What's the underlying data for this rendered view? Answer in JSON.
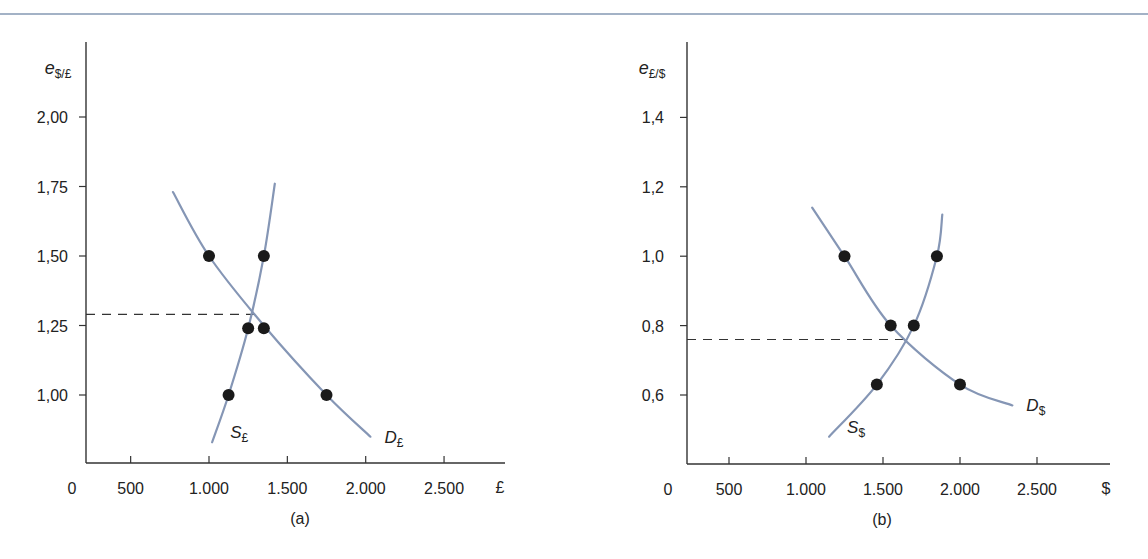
{
  "colors": {
    "curve": "#8596b5",
    "axis": "#333333",
    "point": "#1a1a1a",
    "rule": "#a3b2c6"
  },
  "chart_data": [
    {
      "type": "line",
      "panel_label": "(a)",
      "ylabel_main": "e",
      "ylabel_sub": "$/£",
      "xunit": "£",
      "xlim": [
        0,
        2700
      ],
      "ylim": [
        0.8,
        2.12
      ],
      "x_ticks": [
        500,
        1000,
        1500,
        2000,
        2500
      ],
      "x_tick_labels": [
        "500",
        "1.000",
        "1.500",
        "2.000",
        "2.500"
      ],
      "x_origin_label": "0",
      "y_ticks": [
        1.0,
        1.25,
        1.5,
        1.75,
        2.0
      ],
      "y_tick_labels": [
        "1,00",
        "1,25",
        "1,50",
        "1,75",
        "2,00"
      ],
      "equilibrium_rate": 1.29,
      "series": [
        {
          "name": "D",
          "sub": "£",
          "kind": "demand",
          "curve": [
            [
              770,
              1.73
            ],
            [
              1000,
              1.5
            ],
            [
              1350,
              1.25
            ],
            [
              1750,
              1.0
            ],
            [
              2030,
              0.85
            ]
          ],
          "points": [
            [
              1000,
              1.5
            ],
            [
              1350,
              1.24
            ],
            [
              1750,
              1.0
            ]
          ]
        },
        {
          "name": "S",
          "sub": "£",
          "kind": "supply",
          "curve": [
            [
              1020,
              0.83
            ],
            [
              1125,
              1.0
            ],
            [
              1250,
              1.24
            ],
            [
              1350,
              1.5
            ],
            [
              1420,
              1.76
            ]
          ],
          "points": [
            [
              1125,
              1.0
            ],
            [
              1250,
              1.24
            ],
            [
              1350,
              1.5
            ]
          ]
        }
      ]
    },
    {
      "type": "line",
      "panel_label": "(b)",
      "ylabel_main": "e",
      "ylabel_sub": "£/$",
      "xunit": "$",
      "xlim": [
        0,
        2750
      ],
      "ylim": [
        0.4,
        1.48
      ],
      "x_ticks": [
        500,
        1000,
        1500,
        2000,
        2500
      ],
      "x_tick_labels": [
        "500",
        "1.000",
        "1.500",
        "2.000",
        "2.500"
      ],
      "x_origin_label": "0",
      "y_ticks": [
        0.6,
        0.8,
        1.0,
        1.2,
        1.4
      ],
      "y_tick_labels": [
        "0,6",
        "0,8",
        "1,0",
        "1,2",
        "1,4"
      ],
      "equilibrium_rate": 0.76,
      "series": [
        {
          "name": "D",
          "sub": "$",
          "kind": "demand",
          "curve": [
            [
              1040,
              1.14
            ],
            [
              1250,
              1.0
            ],
            [
              1550,
              0.8
            ],
            [
              2000,
              0.63
            ],
            [
              2340,
              0.57
            ]
          ],
          "points": [
            [
              1250,
              1.0
            ],
            [
              1550,
              0.8
            ],
            [
              2000,
              0.63
            ]
          ]
        },
        {
          "name": "S",
          "sub": "$",
          "kind": "supply",
          "curve": [
            [
              1150,
              0.48
            ],
            [
              1460,
              0.63
            ],
            [
              1700,
              0.8
            ],
            [
              1850,
              1.0
            ],
            [
              1885,
              1.12
            ]
          ],
          "points": [
            [
              1460,
              0.63
            ],
            [
              1700,
              0.8
            ],
            [
              1850,
              1.0
            ]
          ]
        }
      ]
    }
  ]
}
